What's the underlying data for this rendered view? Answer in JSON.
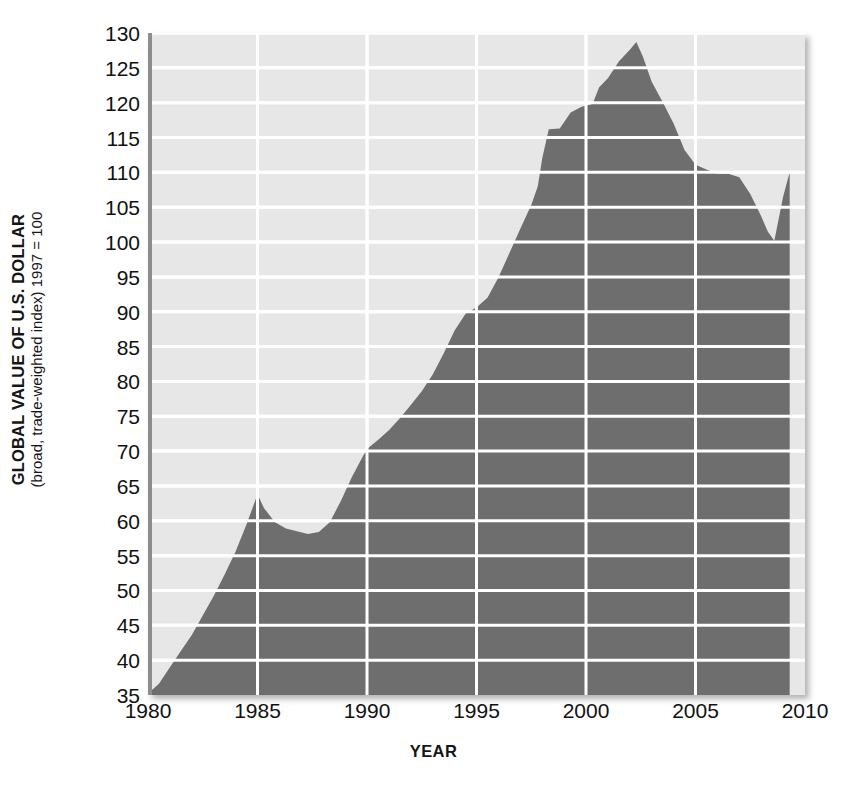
{
  "axes": {
    "y_title_main": "GLOBAL VALUE OF U.S. DOLLAR",
    "y_title_sub": "(broad, trade-weighted index) 1997 = 100",
    "x_title": "YEAR"
  },
  "colors": {
    "plot_background": "#e7e7e7",
    "area_fill": "#6e6e6e",
    "gridline": "#ffffff",
    "tick_text": "#111111",
    "page_background": "#ffffff"
  },
  "chart_data": {
    "type": "area",
    "title": "",
    "xlabel": "YEAR",
    "ylabel": "GLOBAL VALUE OF U.S. DOLLAR (broad, trade-weighted index) 1997 = 100",
    "xlim": [
      1980,
      2010
    ],
    "ylim": [
      35,
      130
    ],
    "grid": true,
    "legend": "none",
    "ytick_labels": [
      "130",
      "125",
      "120",
      "115",
      "110",
      "105",
      "100",
      "95",
      "90",
      "85",
      "80",
      "75",
      "70",
      "65",
      "60",
      "55",
      "50",
      "45",
      "40",
      "35"
    ],
    "yticks": [
      130,
      125,
      120,
      115,
      110,
      105,
      100,
      95,
      90,
      85,
      80,
      75,
      70,
      65,
      60,
      55,
      50,
      45,
      40,
      35
    ],
    "xtick_labels": [
      "1980",
      "1985",
      "1990",
      "1995",
      "2000",
      "2005",
      "2010"
    ],
    "xticks": [
      1980,
      1985,
      1990,
      1995,
      2000,
      2005,
      2010
    ],
    "series_name": "Broad trade-weighted U.S. dollar index",
    "x": [
      1980.0,
      1980.5,
      1981.0,
      1981.5,
      1982.0,
      1982.5,
      1983.0,
      1983.5,
      1984.0,
      1984.5,
      1985.0,
      1985.3,
      1985.8,
      1986.3,
      1986.8,
      1987.3,
      1987.8,
      1988.3,
      1988.8,
      1989.3,
      1989.8,
      1990.0,
      1990.5,
      1991.0,
      1991.5,
      1992.0,
      1992.5,
      1993.0,
      1993.5,
      1994.0,
      1994.5,
      1995.0,
      1995.5,
      1996.0,
      1996.5,
      1997.0,
      1997.5,
      1997.8,
      1998.0,
      1998.3,
      1998.8,
      1999.3,
      1999.8,
      2000.3,
      2000.6,
      2001.0,
      2001.5,
      2002.0,
      2002.3,
      2002.6,
      2003.0,
      2003.5,
      2004.0,
      2004.5,
      2005.0,
      2005.5,
      2006.0,
      2006.5,
      2007.0,
      2007.5,
      2008.0,
      2008.3,
      2008.6,
      2009.0,
      2009.3
    ],
    "y": [
      35.2,
      36.6,
      39.0,
      41.3,
      43.6,
      46.4,
      49.2,
      52.3,
      55.6,
      59.5,
      63.8,
      61.8,
      59.8,
      58.9,
      58.5,
      58.1,
      58.4,
      59.8,
      62.8,
      66.2,
      69.2,
      70.3,
      71.6,
      73.0,
      74.7,
      76.6,
      78.6,
      81.0,
      84.0,
      87.3,
      89.7,
      90.6,
      92.0,
      94.9,
      98.4,
      101.9,
      105.3,
      108.0,
      112.0,
      116.2,
      116.3,
      118.6,
      119.4,
      119.8,
      122.2,
      123.5,
      125.9,
      127.6,
      128.7,
      126.6,
      123.0,
      120.1,
      117.0,
      113.2,
      111.1,
      110.4,
      109.8,
      109.8,
      109.3,
      106.9,
      103.7,
      101.5,
      100.2,
      106.5,
      110.0
    ],
    "annotations": [
      {
        "label": "peak",
        "x": 2002.3,
        "y": 128.7
      },
      {
        "label": "mid-1980s peak",
        "x": 1985.0,
        "y": 63.8
      },
      {
        "label": "late-1980s trough",
        "x": 1987.3,
        "y": 58.1
      },
      {
        "label": "2008 trough",
        "x": 2008.6,
        "y": 100.2
      },
      {
        "label": "start",
        "x": 1980.0,
        "y": 35.2
      },
      {
        "label": "end",
        "x": 2009.3,
        "y": 110.0
      }
    ]
  }
}
